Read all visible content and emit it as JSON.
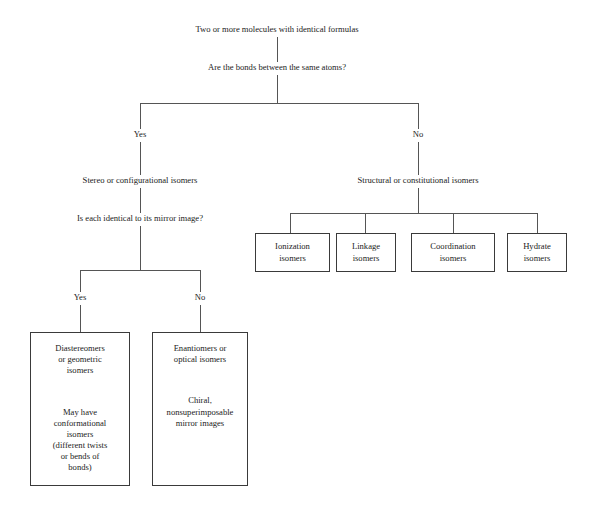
{
  "diagram": {
    "root": "Two or more molecules with identical formulas",
    "question_1": "Are the bonds between the same atoms?",
    "branch_yes_1": "Yes",
    "branch_no_1": "No",
    "stereo_label": "Stereo or configurational isomers",
    "structural_label": "Structural or constitutional isomers",
    "question_2": "Is each identical to its mirror image?",
    "branch_yes_2": "Yes",
    "branch_no_2": "No",
    "structural_boxes": [
      {
        "name": "ionization-isomers-box",
        "text": "Ionization\nisomers"
      },
      {
        "name": "linkage-isomers-box",
        "text": "Linkage\nisomers"
      },
      {
        "name": "coordination-isomers-box",
        "text": "Coordination\nisomers"
      },
      {
        "name": "hydrate-isomers-box",
        "text": "Hydrate\nisomers"
      }
    ],
    "stereo_boxes": [
      {
        "name": "diastereomers-box",
        "top": "Diastereomers\nor geometric\nisomers",
        "bottom": "May have\nconformational\nisomers\n(different twists\nor bends of\nbonds)"
      },
      {
        "name": "enantiomers-box",
        "top": "Enantiomers or\noptical isomers",
        "bottom": "Chiral,\nnonsuperimposable\nmirror images"
      }
    ],
    "colors": {
      "line": "#555555",
      "box_border": "#3a3a3a",
      "text": "#222222",
      "background": "#ffffff"
    }
  }
}
